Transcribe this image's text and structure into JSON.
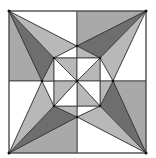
{
  "diagram": {
    "title": "",
    "colors": {
      "dark": "#6e6e6e",
      "mid": "#a9a9a9",
      "light": "#c4c4c4",
      "white": "#ffffff",
      "stroke": "#333333"
    },
    "outer_square": {
      "x1": 9,
      "y1": 11,
      "x2": 146,
      "y2": 153
    },
    "center": [
      77,
      81
    ],
    "star_points": [
      [
        77,
        46
      ],
      [
        100,
        58
      ],
      [
        113,
        81
      ],
      [
        100,
        106
      ],
      [
        77,
        117
      ],
      [
        54,
        106
      ],
      [
        42,
        81
      ],
      [
        54,
        58
      ]
    ],
    "inner_square": {
      "x1": 54,
      "y1": 58,
      "x2": 100,
      "y2": 106
    }
  }
}
